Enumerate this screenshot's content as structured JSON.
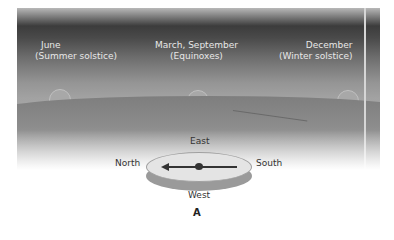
{
  "diagram": {
    "columns": [
      {
        "month": "June",
        "event": "(Summer solstice)"
      },
      {
        "month": "March, September",
        "event": "(Equinoxes)"
      },
      {
        "month": "December",
        "event": "(Winter solstice)"
      }
    ],
    "compass": {
      "top": "East",
      "left": "North",
      "right": "South",
      "bottom": "West"
    },
    "figure_label": "A"
  }
}
